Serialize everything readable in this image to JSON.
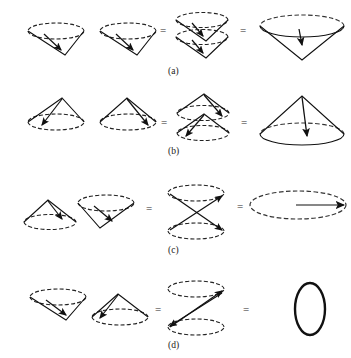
{
  "figure": {
    "background_color": "#ffffff",
    "stroke_color": "#1a1a1a",
    "dash_color": "#333333",
    "equals_symbol": "=",
    "rows": [
      {
        "id": "a",
        "label": "(a)",
        "description": "downward cone plus downward cone equals stacked downward cones equals single large downward cone",
        "operands": [
          {
            "name": "cone-down-left",
            "orientation": "down",
            "arrow": "apex-inward"
          },
          {
            "name": "cone-down-right",
            "orientation": "down",
            "arrow": "apex-inward"
          }
        ],
        "intermediate": {
          "name": "stacked-cones-down",
          "orientation": "down",
          "count": 2
        },
        "result": {
          "name": "large-cone-down",
          "orientation": "down",
          "arrow": "vertical-down"
        }
      },
      {
        "id": "b",
        "label": "(b)",
        "description": "upward cone plus upward cone equals stacked upward cones equals single large upward cone",
        "operands": [
          {
            "name": "cone-up-left",
            "orientation": "up",
            "arrow": "apex-outward"
          },
          {
            "name": "cone-up-right",
            "orientation": "up",
            "arrow": "apex-outward"
          }
        ],
        "intermediate": {
          "name": "stacked-cones-up",
          "orientation": "up",
          "count": 2
        },
        "result": {
          "name": "large-cone-up",
          "orientation": "up",
          "arrow": "vertical-down"
        }
      },
      {
        "id": "c",
        "label": "(c)",
        "description": "upward cone plus downward cone equals double cone hourglass equals flat ellipse with horizontal arrow",
        "operands": [
          {
            "name": "cone-up-left",
            "orientation": "up",
            "arrow": "apex-outward"
          },
          {
            "name": "cone-down-right",
            "orientation": "down",
            "arrow": "apex-inward"
          }
        ],
        "intermediate": {
          "name": "double-cone-hourglass",
          "orientation": "hourglass",
          "count": 2
        },
        "result": {
          "name": "flat-ellipse-with-arrow",
          "orientation": "flat",
          "arrow": "horizontal-right"
        }
      },
      {
        "id": "d",
        "label": "(d)",
        "description": "downward cone plus upward cone equals double cone hourglass equals vertical solid ellipse",
        "operands": [
          {
            "name": "cone-down-left",
            "orientation": "down",
            "arrow": "apex-inward"
          },
          {
            "name": "cone-up-right",
            "orientation": "up",
            "arrow": "apex-outward"
          }
        ],
        "intermediate": {
          "name": "double-cone-hourglass",
          "orientation": "hourglass",
          "count": 2
        },
        "result": {
          "name": "vertical-ellipse",
          "orientation": "vertical",
          "arrow": "none"
        }
      }
    ]
  }
}
